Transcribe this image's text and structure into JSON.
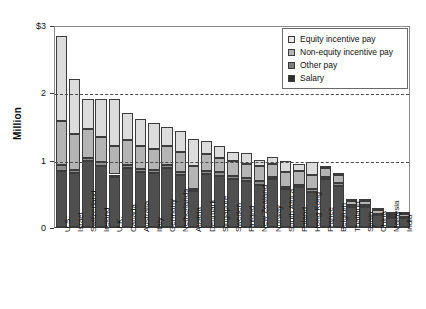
{
  "chart_data": {
    "type": "bar",
    "title": "",
    "subtitle": "",
    "xlabel": "",
    "ylabel": "Million",
    "ylim": [
      0,
      3
    ],
    "yticks": [
      "0",
      "1",
      "2",
      "$3"
    ],
    "ytick_values": [
      0,
      1,
      2,
      3
    ],
    "grid": "horizontal dashed at y=1 and y=2",
    "stacked": true,
    "legend_position": "top-right inside plot",
    "units": "USD millions",
    "categories": [
      "U.S.",
      "Israel",
      "Switzerland",
      "Ireland",
      "U.K.",
      "Canada",
      "Australia",
      "Italy",
      "Germany",
      "Netherlands",
      "Austria",
      "Denmark",
      "Singapore",
      "Sweden",
      "Finland",
      "New Zealand",
      "Norway",
      "South Africa",
      "Poland",
      "Hong Kong",
      "France",
      "Belgium",
      "Thailand",
      "Spain",
      "China",
      "Malaysia",
      "India"
    ],
    "series": [
      {
        "name": "Salary",
        "color": "#4f4f4f",
        "values": [
          0.83,
          0.8,
          0.98,
          0.91,
          0.74,
          0.88,
          0.82,
          0.8,
          0.88,
          0.77,
          0.54,
          0.78,
          0.76,
          0.72,
          0.69,
          0.63,
          0.71,
          0.56,
          0.59,
          0.52,
          0.71,
          0.61,
          0.29,
          0.3,
          0.18,
          0.14,
          0.13
        ]
      },
      {
        "name": "Other pay",
        "color": "#8e8e8e",
        "values": [
          0.09,
          0.05,
          0.04,
          0.05,
          0.04,
          0.04,
          0.04,
          0.04,
          0.04,
          0.04,
          0.03,
          0.05,
          0.05,
          0.04,
          0.04,
          0.05,
          0.04,
          0.04,
          0.04,
          0.04,
          0.04,
          0.04,
          0.03,
          0.03,
          0.02,
          0.02,
          0.02
        ]
      },
      {
        "name": "Non-equity incentive pay",
        "color": "#b4b4b4",
        "values": [
          0.65,
          0.53,
          0.44,
          0.37,
          0.42,
          0.37,
          0.35,
          0.32,
          0.29,
          0.31,
          0.33,
          0.25,
          0.22,
          0.22,
          0.2,
          0.23,
          0.18,
          0.22,
          0.2,
          0.21,
          0.13,
          0.12,
          0.06,
          0.05,
          0.05,
          0.04,
          0.05
        ]
      },
      {
        "name": "Equity incentive pay",
        "color": "#dcdcdc",
        "values": [
          1.26,
          0.82,
          0.44,
          0.57,
          0.7,
          0.41,
          0.39,
          0.38,
          0.28,
          0.3,
          0.4,
          0.2,
          0.17,
          0.14,
          0.17,
          0.09,
          0.11,
          0.16,
          0.1,
          0.2,
          0.03,
          0.03,
          0.02,
          0.02,
          0.03,
          0.02,
          0.03
        ]
      }
    ],
    "totals": [
      2.83,
      2.2,
      1.9,
      1.9,
      1.9,
      1.7,
      1.6,
      1.54,
      1.49,
      1.42,
      1.3,
      1.28,
      1.2,
      1.12,
      1.1,
      1.0,
      1.04,
      0.98,
      0.93,
      0.97,
      0.91,
      0.8,
      0.4,
      0.4,
      0.28,
      0.22,
      0.23
    ]
  },
  "legend": {
    "items": [
      {
        "label": "Equity incentive pay",
        "swatch": "equity"
      },
      {
        "label": "Non-equity incentive pay",
        "swatch": "nonequity"
      },
      {
        "label": "Other pay",
        "swatch": "other"
      },
      {
        "label": "Salary",
        "swatch": "salary"
      }
    ]
  },
  "axis": {
    "y_title": "Million"
  }
}
